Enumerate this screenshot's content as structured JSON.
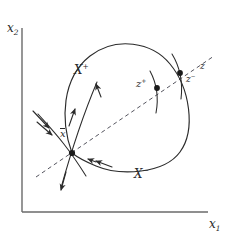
{
  "figure": {
    "type": "phase-portrait-diagram",
    "background_color": "#ffffff",
    "ink_color": "#2b2b2b",
    "width": 232,
    "height": 240
  },
  "axes": {
    "x_label": "x",
    "x_label_sub": "1",
    "y_label": "x",
    "y_label_sub": "2",
    "origin": [
      22,
      212
    ],
    "x_axis_end": [
      208,
      212
    ],
    "y_axis_top": [
      22,
      28
    ],
    "color": "#555555"
  },
  "regions": [
    {
      "name": "positive-region",
      "label": "X",
      "superscript": "+",
      "x": 74,
      "y": 64
    },
    {
      "name": "negative-region",
      "label": "X",
      "superscript": "−",
      "x": 134,
      "y": 168
    }
  ],
  "points": [
    {
      "name": "equilibrium-point",
      "label": "x",
      "overbar": true,
      "superscript": "",
      "cx": 72,
      "cy": 153,
      "label_x": 60,
      "label_y": 128
    },
    {
      "name": "z-plus-point",
      "label": "z",
      "overbar": false,
      "superscript": "+",
      "cx": 157,
      "cy": 88,
      "label_x": 136,
      "label_y": 79
    },
    {
      "name": "z-minus-point",
      "label": "z",
      "overbar": false,
      "superscript": "−",
      "cx": 180,
      "cy": 73,
      "label_x": 186,
      "label_y": 75
    }
  ],
  "annotations": [
    {
      "name": "z-label",
      "label": "z",
      "superscript": "",
      "x": 200,
      "y": 62
    }
  ],
  "curves": {
    "homoclinic_loop": "M 72 153 C 60 120 62 78 90 56 C 116 36 152 42 170 64 C 190 88 196 130 180 152 C 164 174 120 176 96 166 C 84 161 77 157 72 153 Z",
    "dashed_line": "M 36 177 L 214 56",
    "transversal_z_plus": "M 150 72 C 157 84 158 96 156 112",
    "transversal_z_minus": "M 173 56 C 180 68 182 82 181 98",
    "stable_manifold": "M 40 116 C 54 132 66 144 84 172",
    "unstable_manifold": "M 96 84 C 86 108 76 132 62 186"
  },
  "flow_arrows": [
    {
      "name": "arrow-loop-left-up",
      "x": 74,
      "y": 113,
      "angle": -72
    },
    {
      "name": "arrow-loop-bottom-left",
      "x": 100,
      "y": 163,
      "angle": 200
    },
    {
      "name": "arrow-manifold-in-upper-left",
      "x": 46,
      "y": 122,
      "angle": 50
    },
    {
      "name": "arrow-manifold-in-lower-left",
      "x": 40,
      "y": 118,
      "angle": 50
    },
    {
      "name": "arrow-manifold-out-up",
      "x": 93,
      "y": 91,
      "angle": -70
    },
    {
      "name": "arrow-manifold-out-down",
      "x": 64,
      "y": 180,
      "angle": 105
    },
    {
      "name": "arrow-manifold-in-right",
      "x": 98,
      "y": 162,
      "angle": 200
    }
  ]
}
